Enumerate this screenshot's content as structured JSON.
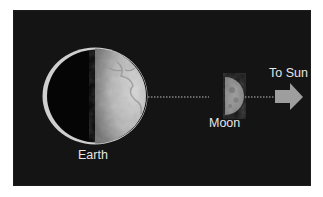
{
  "diagram": {
    "type": "earth-moon-sun-geometry",
    "background_color": "#141414",
    "bodies": [
      {
        "name": "Earth",
        "label": "Earth",
        "phase": "half-lit (right side illuminated)"
      },
      {
        "name": "Moon",
        "label": "Moon",
        "phase": "first quarter (right half illuminated)"
      }
    ],
    "direction": {
      "label": "To Sun",
      "arrow_color": "#9e9e9e"
    },
    "connector": {
      "style": "dotted",
      "color": "#bdbdbd"
    }
  }
}
